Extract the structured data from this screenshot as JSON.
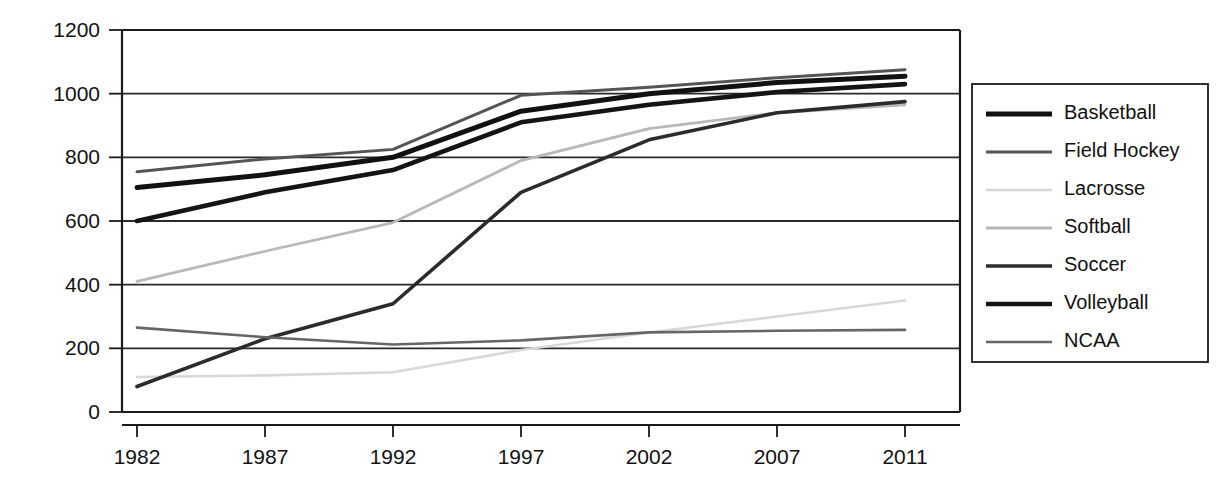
{
  "chart_data": {
    "type": "line",
    "title": "",
    "subtitle": "",
    "xlabel": "",
    "ylabel": "",
    "x": [
      "1982",
      "1987",
      "1992",
      "1997",
      "2002",
      "2007",
      "2011"
    ],
    "xlim": [
      "1982",
      "2011"
    ],
    "ylim": [
      0,
      1200
    ],
    "y_ticks": [
      0,
      200,
      400,
      600,
      800,
      1000,
      1200
    ],
    "x_ticks": [
      "1982",
      "1987",
      "1992",
      "1997",
      "2002",
      "2007",
      "2011"
    ],
    "grid": "horizontal",
    "legend_position": "right",
    "series": [
      {
        "name": "Basketball",
        "values": [
          705,
          745,
          800,
          945,
          1000,
          1035,
          1055
        ],
        "color": "#111111",
        "width": 5.0
      },
      {
        "name": "Field Hockey",
        "values": [
          755,
          795,
          825,
          995,
          1020,
          1050,
          1075
        ],
        "color": "#555555",
        "width": 3.0
      },
      {
        "name": "Lacrosse",
        "values": [
          110,
          115,
          125,
          195,
          250,
          300,
          350
        ],
        "color": "#d8d8d8",
        "width": 2.6
      },
      {
        "name": "Softball",
        "values": [
          410,
          505,
          595,
          790,
          890,
          940,
          965
        ],
        "color": "#b8b8b8",
        "width": 2.8
      },
      {
        "name": "Soccer",
        "values": [
          80,
          230,
          340,
          690,
          855,
          940,
          975
        ],
        "color": "#2b2b2b",
        "width": 3.6
      },
      {
        "name": "Volleyball",
        "values": [
          600,
          690,
          760,
          910,
          965,
          1005,
          1030
        ],
        "color": "#141414",
        "width": 4.6
      },
      {
        "name": "NCAA",
        "values": [
          265,
          235,
          212,
          225,
          250,
          255,
          258
        ],
        "color": "#666666",
        "width": 2.6
      }
    ]
  },
  "axes": {
    "y_tick_labels": [
      "1200",
      "1000",
      "800",
      "600",
      "400",
      "200",
      "0"
    ],
    "x_tick_labels": [
      "1982",
      "1987",
      "1992",
      "1997",
      "2002",
      "2007",
      "2011"
    ]
  },
  "legend": {
    "items": [
      {
        "label": "Basketball"
      },
      {
        "label": "Field Hockey"
      },
      {
        "label": "Lacrosse"
      },
      {
        "label": "Softball"
      },
      {
        "label": "Soccer"
      },
      {
        "label": "Volleyball"
      },
      {
        "label": "NCAA"
      }
    ]
  },
  "colors": {
    "background": "#ffffff",
    "axis": "#1a1a1a",
    "grid": "#2a2a2a",
    "text": "#111111"
  }
}
